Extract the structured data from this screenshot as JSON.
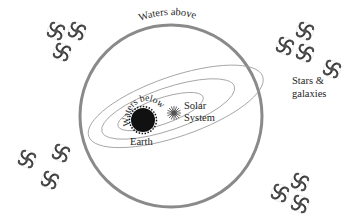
{
  "diagram": {
    "type": "cosmology-illustration",
    "labels": {
      "waters_above": "Waters above",
      "waters_below": "Waters below",
      "earth": "Earth",
      "solar_line1": "Solar",
      "solar_line2": "System",
      "stars_line1": "Stars &",
      "stars_line2": "galaxies"
    },
    "colors": {
      "sphere_stroke": "#8a8a8a",
      "orbit_stroke": "#9a9a9a",
      "earth_fill": "#111111",
      "text": "#1e1e1e",
      "galaxy": "#3a3a3a"
    },
    "galaxy_clusters": [
      {
        "name": "top-left",
        "count": 3
      },
      {
        "name": "top-right",
        "count": 4
      },
      {
        "name": "bottom-left",
        "count": 3
      },
      {
        "name": "bottom-right",
        "count": 3
      }
    ]
  }
}
